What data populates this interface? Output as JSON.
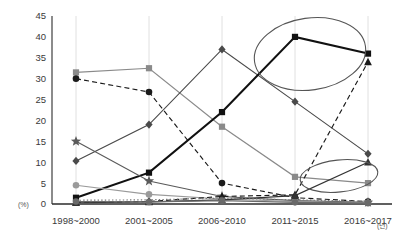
{
  "chart_data": {
    "type": "line",
    "title": "",
    "xlabel": "",
    "ylabel": "",
    "x_unit": "(년)",
    "y_unit": "(%)",
    "grid": "vertical-only",
    "legend_position": "none",
    "categories": [
      "1998~2000",
      "2001~2005",
      "2006~2010",
      "2011~2015",
      "2016~2017"
    ],
    "ylim": [
      0,
      45
    ],
    "yticks": [
      0,
      5,
      10,
      15,
      20,
      25,
      30,
      35,
      40,
      45
    ],
    "series": [
      {
        "name": "series-gray-square",
        "marker": "square",
        "color": "#8a8a8a",
        "line": "solid",
        "values": [
          31.5,
          32.5,
          18.5,
          6.5,
          5.0
        ]
      },
      {
        "name": "series-black-circle-dashed",
        "marker": "circle",
        "color": "#1a1a1a",
        "line": "dashed",
        "values": [
          30.0,
          26.8,
          5.0,
          1.5,
          0.6
        ]
      },
      {
        "name": "series-gray-diamond",
        "marker": "diamond",
        "color": "#4a4a4a",
        "line": "solid",
        "values": [
          10.3,
          19.0,
          37.0,
          24.5,
          12.0
        ]
      },
      {
        "name": "series-black-square",
        "marker": "square",
        "color": "#111111",
        "line": "solid",
        "values": [
          1.5,
          7.5,
          22.0,
          40.0,
          36.0
        ]
      },
      {
        "name": "series-star",
        "marker": "star",
        "color": "#5a5a5a",
        "line": "solid",
        "values": [
          15.0,
          5.5,
          1.8,
          0.8,
          0.4
        ]
      },
      {
        "name": "series-gray-circle",
        "marker": "circle",
        "color": "#9a9a9a",
        "line": "solid",
        "values": [
          4.5,
          2.3,
          1.2,
          0.6,
          0.3
        ]
      },
      {
        "name": "series-triangle-dashed",
        "marker": "triangle",
        "color": "#1a1a1a",
        "line": "dashed",
        "values": [
          0.4,
          0.6,
          1.8,
          2.2,
          34.0
        ]
      },
      {
        "name": "series-triangle-rising",
        "marker": "triangle",
        "color": "#333333",
        "line": "solid",
        "values": [
          0.3,
          0.5,
          1.0,
          2.0,
          10.0
        ]
      },
      {
        "name": "series-dotted-low",
        "marker": "none",
        "color": "#777777",
        "line": "dotted",
        "values": [
          0.9,
          1.0,
          1.4,
          1.0,
          0.6
        ]
      },
      {
        "name": "series-flat-low",
        "marker": "circle",
        "color": "#6a6a6a",
        "line": "solid",
        "values": [
          0.6,
          0.5,
          0.8,
          0.4,
          0.2
        ]
      }
    ],
    "annotations": [
      {
        "name": "highlight-ellipse-upper",
        "cx": 310,
        "cy": 54,
        "rx": 56,
        "ry": 36,
        "rotate": -8
      },
      {
        "name": "highlight-ellipse-lower",
        "cx": 339,
        "cy": 176,
        "rx": 39,
        "ry": 16,
        "rotate": -6
      }
    ]
  }
}
